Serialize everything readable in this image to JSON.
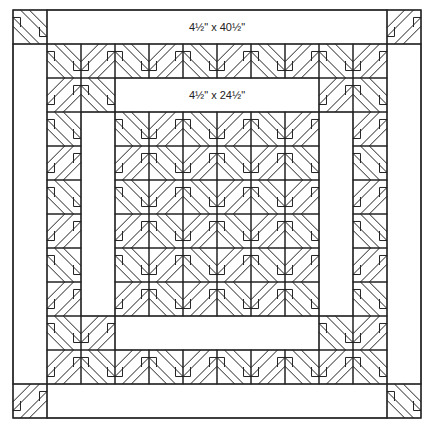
{
  "diagram": {
    "type": "quilt-layout",
    "block_size_px": 34,
    "colors": {
      "line": "#222222",
      "background": "#ffffff"
    },
    "outer_border": {
      "top_label": "4½\" x 40½\"",
      "corner_blocks": 4
    },
    "inner_border": {
      "top_label": "4½\" x 24½\""
    },
    "grid": {
      "outer_cols": 12,
      "outer_rows": 12,
      "inner_pieced_ring_cols": 10,
      "center_blocks": "6 x 6"
    }
  }
}
